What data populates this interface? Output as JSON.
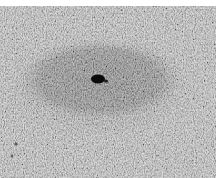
{
  "image": {
    "kind": "grayscale micrograph",
    "description": "Textured tissue field with a darker oval region centered slightly left, containing a small black spot near its center",
    "colors": {
      "background_tissue": "#bdbdbd",
      "dark_region": "#7a7a7a",
      "halo": "#a8a8a8",
      "spot": "#0a0a0a",
      "top_border": "#ffffff"
    },
    "features": {
      "dark_oval": {
        "cx": 100,
        "cy": 74,
        "rx": 78,
        "ry": 38
      },
      "halo_oval": {
        "cx": 100,
        "cy": 80,
        "rx": 100,
        "ry": 52
      },
      "spot": {
        "cx": 99,
        "cy": 73,
        "rx": 7,
        "ry": 4
      }
    }
  }
}
